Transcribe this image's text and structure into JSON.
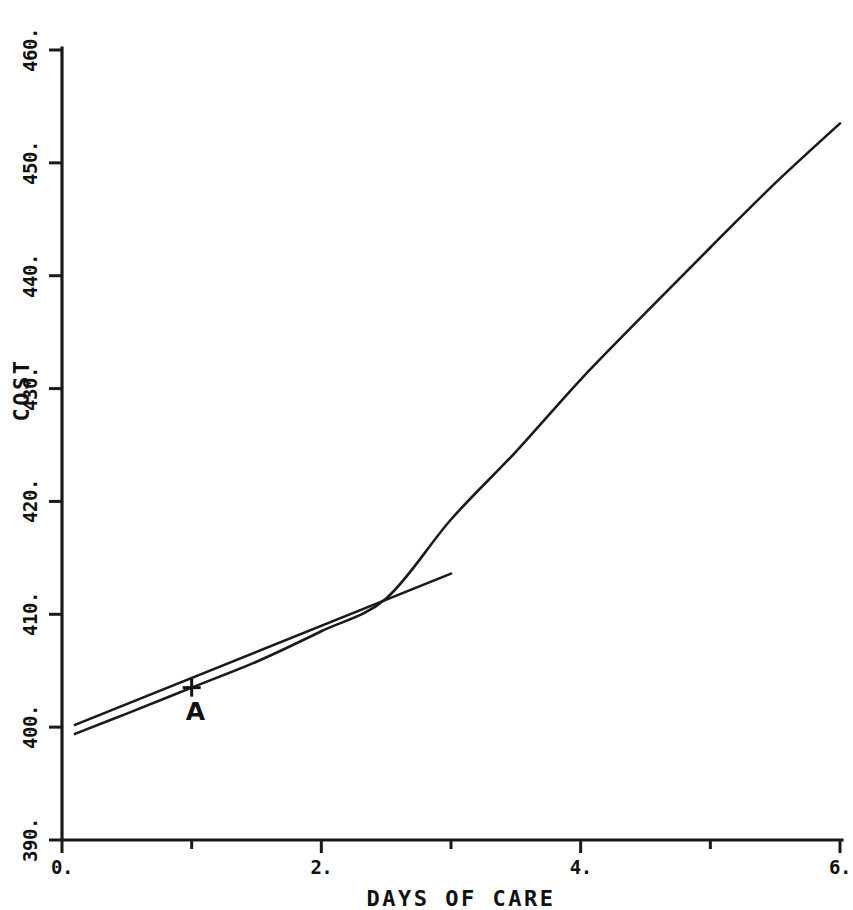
{
  "chart_data": {
    "type": "line",
    "title": "",
    "xlabel": "DAYS OF CARE",
    "ylabel": "COST",
    "xlim": [
      0,
      6
    ],
    "ylim": [
      390,
      460
    ],
    "grid": false,
    "legend": "none",
    "xticks": [
      "0.",
      "2.",
      "4.",
      "6."
    ],
    "xtick_values": [
      0,
      2,
      4,
      6
    ],
    "yticks": [
      "390.",
      "400.",
      "410.",
      "420.",
      "430.",
      "440.",
      "450.",
      "460."
    ],
    "ytick_values": [
      390,
      400,
      410,
      420,
      430,
      440,
      450,
      460
    ],
    "x_minor_step": 1,
    "y_minor_step": 10,
    "series": [
      {
        "name": "cost-curve",
        "kind": "curve",
        "x": [
          0.1,
          0.5,
          1.0,
          1.5,
          2.0,
          2.5,
          3.0,
          3.5,
          4.0,
          4.5,
          5.0,
          5.5,
          6.0
        ],
        "values": [
          399.4,
          401.2,
          403.5,
          405.8,
          408.5,
          411.4,
          418.4,
          424.4,
          430.8,
          436.7,
          442.5,
          448.2,
          453.5
        ]
      },
      {
        "name": "tangent-line",
        "kind": "line",
        "x": [
          0.1,
          3.0
        ],
        "values": [
          400.2,
          413.6
        ]
      }
    ],
    "annotations": [
      {
        "name": "point-a",
        "label": "A",
        "marker": "plus",
        "x": 1.0,
        "y": 403.5
      }
    ]
  },
  "colors": {
    "ink": "#1a1a1a",
    "background": "#ffffff"
  }
}
